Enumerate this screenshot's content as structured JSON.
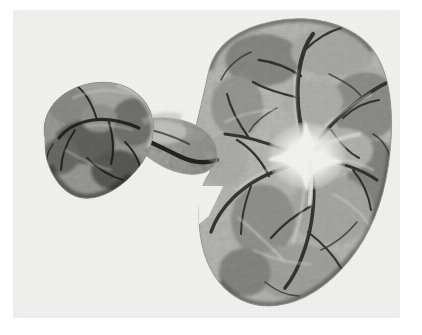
{
  "page": {
    "background_color": "#ffffff",
    "width": 422,
    "height": 335,
    "caption": ""
  },
  "photograph": {
    "kind": "gross-pathology-specimen-photograph",
    "medium": "black-and-white photographic print",
    "print_background_color": "#f2f2f1",
    "frame": {
      "left": 13,
      "top": 10,
      "width": 387,
      "height": 308
    },
    "tonal_range": {
      "darkest": "#1d1d1d",
      "mid": "#6e6e6e",
      "light": "#c9c9c7",
      "highlight": "#f6f6f4"
    },
    "subject": {
      "description": "bilobed organ specimen, cut surface, with a small rounded lobe joined by a narrow pedicle to a large reniform lobe",
      "parts": [
        {
          "name": "small-left-lobe",
          "label": "small rounded lobe",
          "tone": "dark",
          "approx_bounds": {
            "x": 15,
            "y": 75,
            "width": 115,
            "height": 120
          }
        },
        {
          "name": "connecting-isthmus",
          "label": "narrow connecting pedicle",
          "tone": "light",
          "approx_bounds": {
            "x": 125,
            "y": 105,
            "width": 80,
            "height": 55
          }
        },
        {
          "name": "large-right-lobe",
          "label": "large reniform lobe",
          "tone": "mid",
          "approx_bounds": {
            "x": 185,
            "y": 12,
            "width": 195,
            "height": 285
          }
        },
        {
          "name": "hilum",
          "label": "bright hilar region with radiating branches",
          "tone": "highlight",
          "approx_bounds": {
            "x": 250,
            "y": 100,
            "width": 85,
            "height": 75
          }
        },
        {
          "name": "marginal-notch",
          "label": "notch on medial border of large lobe",
          "tone": "background",
          "approx_bounds": {
            "x": 190,
            "y": 175,
            "width": 40,
            "height": 45
          }
        }
      ],
      "features": [
        {
          "name": "branching-vessels",
          "label": "dark branching vascular channels"
        },
        {
          "name": "mottled-parenchyma",
          "label": "mottled cut-surface parenchyma"
        },
        {
          "name": "capsular-margin",
          "label": "smooth capsular outline"
        }
      ]
    }
  }
}
